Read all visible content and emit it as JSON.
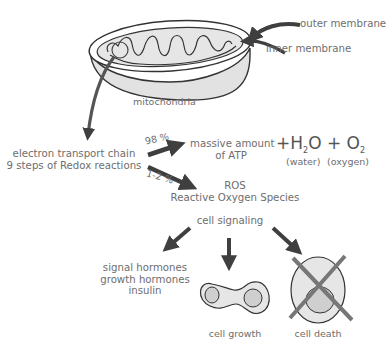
{
  "top_cutoff_text": "...",
  "mitochondria": {
    "label": "mitochondria",
    "outer_membrane_label": "outer membrane",
    "inner_membrane_label": "inner membrane"
  },
  "etc": {
    "line1": "electron transport chain",
    "line2": "9 steps of Redox reactions"
  },
  "branches": {
    "atp_percent": "98 %",
    "atp_line1": "massive amount",
    "atp_line2": "of ATP",
    "ros_percent": "1-2 %",
    "ros_line1": "ROS",
    "ros_line2": "Reactive Oxygen Species"
  },
  "products": {
    "plus1": "+",
    "water_formula_H": "H",
    "water_formula_sub": "2",
    "water_formula_O": "O",
    "plus2": "+",
    "oxygen_formula_O": "O",
    "oxygen_formula_sub": "2",
    "water_label": "(water)",
    "oxygen_label": "(oxygen)"
  },
  "signaling": {
    "label": "cell signaling",
    "hormones": [
      "signal hormones",
      "growth hormones",
      "insulin"
    ],
    "cell_growth_label": "cell growth",
    "cell_death_label": "cell death"
  },
  "colors": {
    "arrow": "#3f3f3f",
    "text": "#6e6e6e",
    "fill": "#e4e4e4",
    "nucleus": "#cfcfcf",
    "cross": "#777777"
  }
}
